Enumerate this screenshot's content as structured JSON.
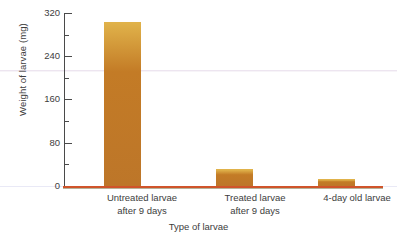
{
  "chart_data": {
    "type": "bar",
    "title": "",
    "categories": [
      "Untreated larvae after 9 days",
      "Treated larvae after 9 days",
      "4-day old larvae"
    ],
    "category_lines": [
      [
        "Untreated larvae",
        "after 9 days"
      ],
      [
        "Treated larvae",
        "after 9 days"
      ],
      [
        "4-day old larvae",
        ""
      ]
    ],
    "values": [
      304,
      32,
      13
    ],
    "xlabel": "Type of larvae",
    "ylabel": "Weight of larvae (mg)",
    "ylim": [
      0,
      320
    ],
    "ytick_labels": [
      "0",
      "80",
      "160",
      "240",
      "320"
    ],
    "ytick_values": [
      0,
      80,
      160,
      240,
      320
    ],
    "yminor_values": [
      40,
      120,
      200,
      280
    ],
    "grid": false,
    "legend": null,
    "bar_color": "#c37b26",
    "bar_highlight_color": "#e0b24a",
    "axis_color": "#4a4a4a",
    "baseline_color": "#d0542a",
    "background_color": "#ffffff"
  }
}
